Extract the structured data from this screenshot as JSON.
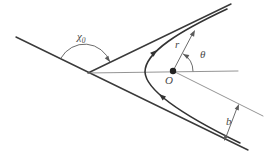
{
  "diagram": {
    "labels": {
      "scattering_angle": "χ",
      "scattering_angle_sub": "0",
      "radius_vector": "r",
      "polar_angle": "θ",
      "origin": "O",
      "impact_parameter": "b"
    },
    "colors": {
      "background": "#ffffff",
      "main_line": "#333333",
      "thin_line": "#787878",
      "annotation_line": "#5a5a5a",
      "label_text": "#4a4a4a"
    }
  }
}
